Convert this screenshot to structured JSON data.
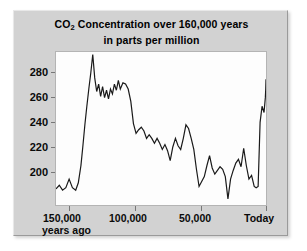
{
  "chart_data": {
    "type": "line",
    "title": "CO2 Concentration over 160,000 years",
    "title_main_pre": "CO",
    "title_main_sub": "2",
    "title_main_post": " Concentration over 160,000 years",
    "subtitle": "in parts per million",
    "xlabel": "years ago",
    "ylabel": "",
    "xlim": [
      160000,
      0
    ],
    "ylim": [
      178,
      302
    ],
    "grid": false,
    "legend": null,
    "line_color": "#1a1a1a",
    "plot_background": "#fdfdfd",
    "panel_background": "#d2d2d2",
    "x_ticks": [
      {
        "value": 150000,
        "label": "150,000"
      },
      {
        "value": 100000,
        "label": "100,000"
      },
      {
        "value": 50000,
        "label": "50,000"
      },
      {
        "value": 0,
        "label": "Today"
      }
    ],
    "y_ticks": [
      {
        "value": 280,
        "label": "280"
      },
      {
        "value": 260,
        "label": "260"
      },
      {
        "value": 240,
        "label": "240"
      },
      {
        "value": 220,
        "label": "220"
      },
      {
        "value": 200,
        "label": "200"
      }
    ],
    "series": [
      {
        "name": "CO2 concentration",
        "x": [
          160000,
          157500,
          155000,
          152500,
          150000,
          147500,
          145000,
          143000,
          141000,
          139500,
          138000,
          136500,
          135000,
          133500,
          132000,
          130500,
          129000,
          127500,
          126000,
          124500,
          123000,
          121500,
          120000,
          118500,
          117000,
          115500,
          114000,
          112500,
          111000,
          109000,
          107000,
          105000,
          103000,
          101000,
          99000,
          97000,
          95000,
          93000,
          91000,
          89000,
          87000,
          85000,
          83000,
          81000,
          79000,
          77000,
          75000,
          73000,
          71000,
          69000,
          67000,
          65000,
          63000,
          61000,
          59000,
          57000,
          55000,
          53000,
          51000,
          49000,
          47000,
          45000,
          43000,
          41000,
          39000,
          37000,
          35000,
          33000,
          31000,
          29000,
          27000,
          25000,
          23000,
          21000,
          19000,
          17000,
          15000,
          13000,
          11000,
          9000,
          7500,
          6000,
          4500,
          3000,
          1500,
          500,
          200,
          0
        ],
        "y": [
          191,
          194,
          190,
          192,
          199,
          192,
          190,
          196,
          210,
          226,
          243,
          258,
          272,
          285,
          300,
          281,
          270,
          276,
          266,
          274,
          265,
          271,
          264,
          272,
          268,
          276,
          271,
          279,
          272,
          277,
          276,
          272,
          262,
          244,
          236,
          239,
          241,
          238,
          232,
          235,
          232,
          228,
          232,
          228,
          223,
          227,
          222,
          214,
          225,
          232,
          226,
          223,
          232,
          243,
          240,
          232,
          223,
          207,
          193,
          197,
          201,
          210,
          218,
          208,
          203,
          206,
          209,
          207,
          201,
          183,
          199,
          206,
          212,
          215,
          209,
          224,
          210,
          199,
          202,
          193,
          192,
          193,
          245,
          258,
          253,
          265,
          272,
          280
        ]
      }
    ]
  }
}
